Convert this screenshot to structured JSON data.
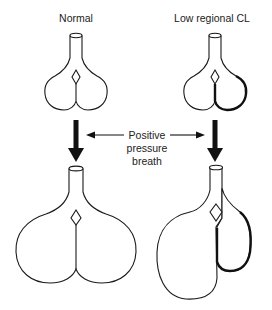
{
  "diagram": {
    "labels": {
      "normal": "Normal",
      "low_cl": "Low regional CL",
      "middle_line1": "Positive",
      "middle_line2": "pressure",
      "middle_line3": "breath"
    },
    "panels": [
      {
        "id": "normal-before",
        "description": "Normal lungs before breath"
      },
      {
        "id": "low-cl-before",
        "description": "Lungs with low regional compliance before breath (right lobe thick outline)"
      },
      {
        "id": "normal-after",
        "description": "Normal lungs inflated uniformly after positive pressure breath"
      },
      {
        "id": "low-cl-after",
        "description": "Lungs with low regional compliance after breath; left lobe overdistended, stiff right lobe small"
      }
    ],
    "colors": {
      "stroke": "#1a1a1a",
      "background": "#ffffff"
    }
  }
}
